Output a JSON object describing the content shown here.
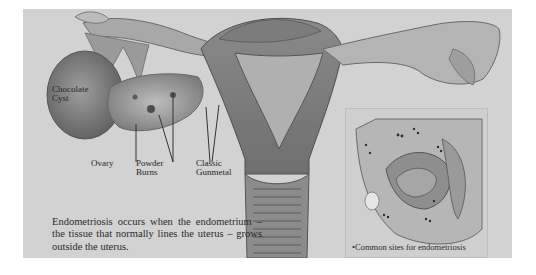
{
  "illustration": {
    "subject": "Female reproductive anatomy showing endometriosis",
    "labels": {
      "chocolate_cyst": [
        "Chocolate",
        "Cyst"
      ],
      "ovary": "Ovary",
      "powder_burns": [
        "Powder",
        "Burns"
      ],
      "classic_gunmetal": [
        "Classic",
        "Gunmetal"
      ]
    },
    "caption": "Endometriosis occurs when the endometrium – the tissue that normally lines the uterus – grows outside the uterus.",
    "inset": {
      "caption": "Common sites for endometriosis",
      "bullet": "•"
    },
    "colors": {
      "background": "#d2d2d2",
      "tissue_dark": "#6e6e6e",
      "tissue_mid": "#9a9a9a",
      "text": "#262626"
    }
  }
}
